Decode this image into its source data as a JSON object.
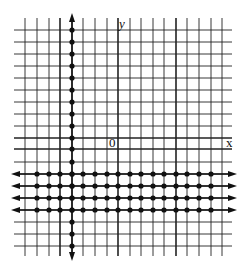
{
  "diagram": {
    "type": "coordinate-grid-graph",
    "axis_labels": {
      "x": "x",
      "y": "y",
      "origin": "0"
    },
    "grid": {
      "x_lines": [
        25,
        37,
        49,
        60,
        72,
        83,
        95,
        107,
        118,
        130,
        141,
        153,
        164,
        176,
        187,
        199,
        211,
        222
      ],
      "y_lines": [
        30,
        42,
        54,
        66,
        78,
        90,
        102,
        114,
        126,
        138,
        149,
        162,
        174,
        186,
        198,
        210,
        222,
        234,
        246
      ],
      "x_axis_y": 149,
      "y_axis_x": 118,
      "bold_x_lines": [
        60,
        176
      ],
      "bold_y_lines": [
        138
      ],
      "line_color": "#222222",
      "left": 14,
      "right": 232,
      "top": 18,
      "bottom": 256
    },
    "vertical_dotted_line": {
      "x": 72,
      "dots_y": [
        30,
        42,
        54,
        66,
        78,
        90,
        102,
        114,
        126,
        138,
        149,
        162,
        174,
        186,
        198,
        210,
        222,
        234,
        246
      ],
      "arrow_top_y": 16,
      "arrow_bottom_y": 258
    },
    "horizontal_dotted_lines": {
      "rows_y": [
        174,
        186,
        198,
        210
      ],
      "dots_x": [
        37,
        49,
        60,
        72,
        83,
        95,
        107,
        118,
        130,
        141,
        153,
        164,
        176,
        187,
        199,
        211
      ],
      "arrow_left_x": 14,
      "arrow_right_x": 234
    },
    "dot_color": "#111111"
  }
}
